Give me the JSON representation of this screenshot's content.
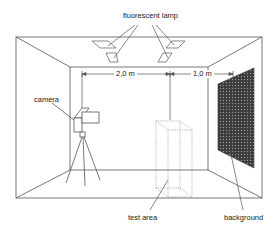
{
  "diagram": {
    "labels": {
      "lamp": "fluorescent lamp",
      "camera": "camera",
      "test_area": "test area",
      "background": "background"
    },
    "dimensions": {
      "camera_to_test_area": "2,0 m",
      "test_area_to_background": "1,0 m"
    },
    "colors": {
      "line": "#555555",
      "background_panel": "#3a3a3a",
      "dotted": "#999999"
    }
  }
}
